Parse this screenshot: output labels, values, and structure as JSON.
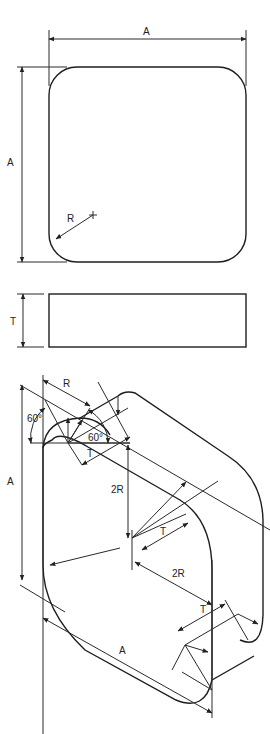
{
  "diagram": {
    "views": [
      {
        "name": "top-view",
        "labels": {
          "width": "A",
          "height": "A",
          "radius": "R"
        }
      },
      {
        "name": "side-view",
        "labels": {
          "thickness": "T"
        }
      },
      {
        "name": "isometric-view",
        "labels": {
          "radius": "R",
          "angle_left": "60°",
          "angle_right": "60°",
          "thickness_top": "T",
          "height": "A",
          "offset_vertical": "2R",
          "thickness_mid": "T",
          "offset_diagonal": "2R",
          "thickness_bottom": "T",
          "length": "A"
        }
      }
    ]
  }
}
